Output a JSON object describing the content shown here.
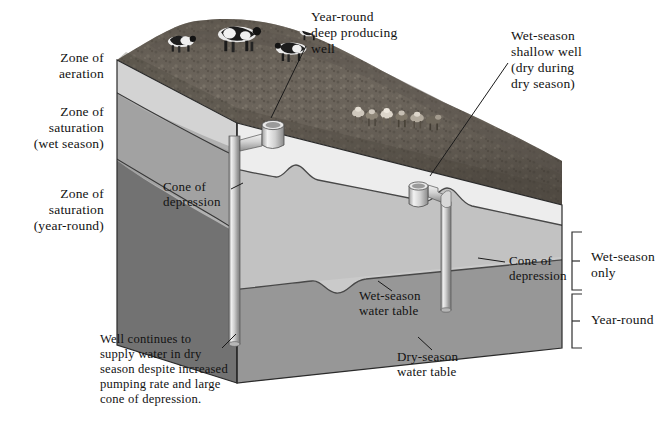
{
  "figure": {
    "kind": "block-diagram",
    "background_color": "#ffffff",
    "text_color": "#121212"
  },
  "left_labels": [
    {
      "id": "zone-aeration",
      "text": "Zone of\naeration"
    },
    {
      "id": "zone-sat-wet",
      "text": "Zone of\nsaturation\n(wet season)"
    },
    {
      "id": "zone-sat-yearround",
      "text": "Zone of\nsaturation\n(year-round)"
    }
  ],
  "callouts": [
    {
      "id": "deep-well",
      "text": "Year-round\ndeep producing\nwell"
    },
    {
      "id": "shallow-well",
      "text": "Wet-season\nshallow well\n(dry during\ndry season)"
    },
    {
      "id": "cone-left",
      "text": "Cone of\ndepression"
    },
    {
      "id": "cone-right",
      "text": "Cone of\ndepression"
    },
    {
      "id": "wet-water-table",
      "text": "Wet-season\nwater table"
    },
    {
      "id": "dry-water-table",
      "text": "Dry-season\nwater table"
    },
    {
      "id": "well-note",
      "text": "Well continues to\nsupply water in dry\nseason despite increased\npumping rate and large\ncone of depression."
    }
  ],
  "brackets": [
    {
      "id": "bracket-wet-only",
      "text": "Wet-season\nonly"
    },
    {
      "id": "bracket-year-round",
      "text": "Year-round"
    }
  ],
  "palette": {
    "grass_dark": "#565049",
    "grass_mid": "#6d665d",
    "grass_light": "#857d72",
    "left_aeration": "#dcdcdc",
    "left_wet": "#a9a9a9",
    "left_year": "#777777",
    "front_aeration": "#f2f2f2",
    "front_wet": "#c6c6c6",
    "front_year": "#9b9b9b",
    "pipe_light": "#f0f0f0",
    "pipe_mid": "#bfbfbf",
    "pipe_dark": "#8d8d8d",
    "outline": "#2a2a2a",
    "leader": "#1a1a1a"
  },
  "scene": {
    "wells": [
      {
        "id": "deep-well-structure",
        "depth": "reaches below dry-season water table"
      },
      {
        "id": "shallow-well-structure",
        "depth": "ends above dry-season water table"
      }
    ],
    "livestock": [
      {
        "id": "cow-group-upper",
        "count": 4,
        "kind": "holstein-cattle"
      },
      {
        "id": "cow-group-lower",
        "count": 6,
        "kind": "herd-cattle"
      }
    ]
  }
}
